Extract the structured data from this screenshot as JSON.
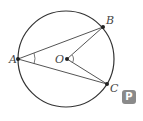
{
  "diagram": {
    "type": "circle-geometry",
    "circle": {
      "cx": 66,
      "cy": 59,
      "r": 48
    },
    "points": {
      "A": {
        "label": "A",
        "x": 18,
        "y": 59
      },
      "B": {
        "label": "B",
        "x": 103,
        "y": 27
      },
      "C": {
        "label": "C",
        "x": 107,
        "y": 84
      },
      "O": {
        "label": "O",
        "x": 67,
        "y": 59
      }
    },
    "segments": [
      "AB",
      "AC",
      "OB",
      "OC"
    ],
    "angle_marks": [
      "BAC",
      "BOC"
    ]
  },
  "labels": {
    "A": "A",
    "B": "B",
    "C": "C",
    "O": "O"
  },
  "badge": {
    "text": "P",
    "color": "#8a8a8a"
  }
}
